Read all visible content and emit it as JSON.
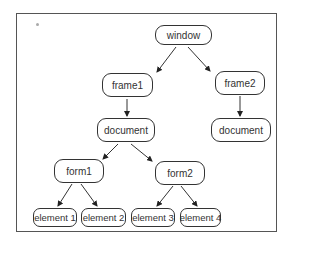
{
  "diagram": {
    "type": "tree",
    "nodes": [
      {
        "id": "window",
        "label": "window"
      },
      {
        "id": "frame1",
        "label": "frame1"
      },
      {
        "id": "frame2",
        "label": "frame2"
      },
      {
        "id": "document1",
        "label": "document"
      },
      {
        "id": "document2",
        "label": "document"
      },
      {
        "id": "form1",
        "label": "form1"
      },
      {
        "id": "form2",
        "label": "form2"
      },
      {
        "id": "element1",
        "label": "element 1"
      },
      {
        "id": "element2",
        "label": "element 2"
      },
      {
        "id": "element3",
        "label": "element 3"
      },
      {
        "id": "element4",
        "label": "element 4"
      }
    ],
    "edges": [
      [
        "window",
        "frame1"
      ],
      [
        "window",
        "frame2"
      ],
      [
        "frame1",
        "document1"
      ],
      [
        "frame2",
        "document2"
      ],
      [
        "document1",
        "form1"
      ],
      [
        "document1",
        "form2"
      ],
      [
        "form1",
        "element1"
      ],
      [
        "form1",
        "element2"
      ],
      [
        "form2",
        "element3"
      ],
      [
        "form2",
        "element4"
      ]
    ]
  },
  "colors": {
    "border": "#333333",
    "frame": "#555555",
    "text": "#333333",
    "background": "#ffffff"
  }
}
